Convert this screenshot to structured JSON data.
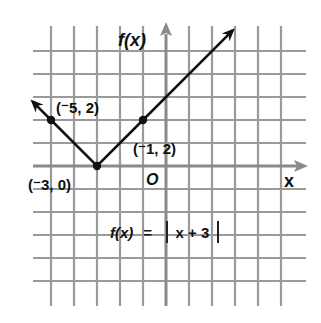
{
  "chart_data": {
    "type": "line",
    "title": "",
    "xlabel": "x",
    "ylabel": "f(x)",
    "function": "f(x) = |x + 3|",
    "xlim": [
      -5,
      5
    ],
    "ylim": [
      -5,
      5
    ],
    "grid": true,
    "origin_label": "O",
    "series": [
      {
        "name": "f(x) = |x + 3|",
        "x": [
          -5.8,
          -5,
          -3,
          -1,
          2.9
        ],
        "y": [
          2.8,
          2,
          0,
          2,
          5.9
        ],
        "arrows_at_ends": true
      }
    ],
    "points": [
      {
        "x": -5,
        "y": 2,
        "label": "(⁻5, 2)"
      },
      {
        "x": -3,
        "y": 0,
        "label": "(⁻3, 0)"
      },
      {
        "x": -1,
        "y": 2,
        "label": "(⁻1, 2)"
      }
    ],
    "annotations": [
      {
        "text": "f(x) = |x + 3|",
        "x": -1.5,
        "y": -2.5
      }
    ]
  },
  "labels": {
    "y_axis": "f(x)",
    "x_axis": "x",
    "origin": "O",
    "point_a": "(⁻5, 2)",
    "point_b": "(⁻1, 2)",
    "point_c": "(⁻3, 0)",
    "formula_lhs": "f(x)",
    "formula_eq": "=",
    "formula_inner": "x + 3"
  },
  "colors": {
    "grid": "#9a9a9a",
    "axis": "#8a8a8a",
    "line": "#111111",
    "text": "#111111"
  }
}
